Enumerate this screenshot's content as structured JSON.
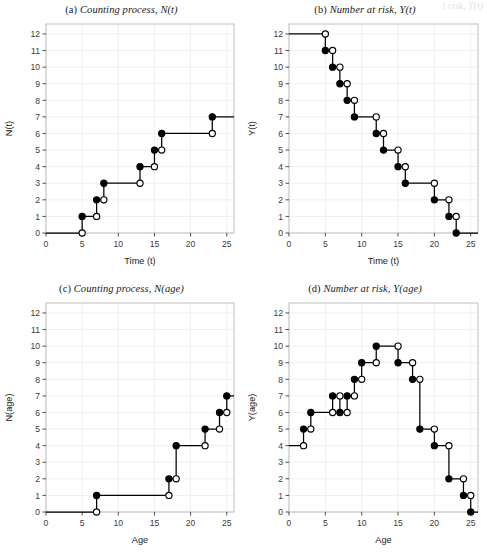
{
  "figure": {
    "artifact_text": "t risk, Y(t)"
  },
  "chart_data": [
    {
      "type": "line",
      "panel": "a",
      "tag": "(a)",
      "title": "Counting process, N(t)",
      "xlabel": "Time (t)",
      "ylabel": "N(t)",
      "xlim": [
        0,
        26
      ],
      "ylim": [
        0,
        12.6
      ],
      "xticks": [
        0,
        5,
        10,
        15,
        20,
        25
      ],
      "yticks": [
        0,
        1,
        2,
        3,
        4,
        5,
        6,
        7,
        8,
        9,
        10,
        11,
        12
      ],
      "grid": true,
      "step_type": "right-continuous-increasing",
      "x": [
        0,
        5,
        7,
        8,
        13,
        15,
        16,
        23,
        26
      ],
      "y": [
        0,
        1,
        2,
        3,
        4,
        5,
        6,
        7,
        7
      ],
      "jump_points": [
        {
          "x": 5,
          "from": 0,
          "to": 1
        },
        {
          "x": 7,
          "from": 1,
          "to": 2
        },
        {
          "x": 8,
          "from": 2,
          "to": 3
        },
        {
          "x": 13,
          "from": 3,
          "to": 4
        },
        {
          "x": 15,
          "from": 4,
          "to": 5
        },
        {
          "x": 16,
          "from": 5,
          "to": 6
        },
        {
          "x": 23,
          "from": 6,
          "to": 7
        }
      ]
    },
    {
      "type": "line",
      "panel": "b",
      "tag": "(b)",
      "title": "Number at risk, Y(t)",
      "xlabel": "Time (t)",
      "ylabel": "Y(t)",
      "xlim": [
        0,
        26
      ],
      "ylim": [
        0,
        12.6
      ],
      "xticks": [
        0,
        5,
        10,
        15,
        20,
        25
      ],
      "yticks": [
        0,
        1,
        2,
        3,
        4,
        5,
        6,
        7,
        8,
        9,
        10,
        11,
        12
      ],
      "grid": true,
      "step_type": "right-continuous-decreasing",
      "x": [
        0,
        5,
        6,
        7,
        8,
        9,
        12,
        13,
        15,
        16,
        20,
        22,
        23,
        26
      ],
      "y": [
        12,
        11,
        10,
        9,
        8,
        7,
        6,
        5,
        4,
        3,
        2,
        1,
        0,
        0
      ],
      "jump_points": [
        {
          "x": 5,
          "from": 12,
          "to": 11
        },
        {
          "x": 6,
          "from": 11,
          "to": 10
        },
        {
          "x": 7,
          "from": 10,
          "to": 9
        },
        {
          "x": 8,
          "from": 9,
          "to": 8
        },
        {
          "x": 9,
          "from": 8,
          "to": 7
        },
        {
          "x": 12,
          "from": 7,
          "to": 6
        },
        {
          "x": 13,
          "from": 6,
          "to": 5
        },
        {
          "x": 15,
          "from": 5,
          "to": 4
        },
        {
          "x": 16,
          "from": 4,
          "to": 3
        },
        {
          "x": 20,
          "from": 3,
          "to": 2
        },
        {
          "x": 22,
          "from": 2,
          "to": 1
        },
        {
          "x": 23,
          "from": 1,
          "to": 0
        }
      ]
    },
    {
      "type": "line",
      "panel": "c",
      "tag": "(c)",
      "title": "Counting process, N(age)",
      "xlabel": "Age",
      "ylabel": "N(age)",
      "xlim": [
        0,
        26
      ],
      "ylim": [
        0,
        12.6
      ],
      "xticks": [
        0,
        5,
        10,
        15,
        20,
        25
      ],
      "yticks": [
        0,
        1,
        2,
        3,
        4,
        5,
        6,
        7,
        8,
        9,
        10,
        11,
        12
      ],
      "grid": true,
      "step_type": "right-continuous-increasing",
      "x": [
        0,
        7,
        17,
        18,
        22,
        24,
        25,
        26
      ],
      "y": [
        0,
        1,
        2,
        4,
        5,
        6,
        7,
        7
      ],
      "jump_points": [
        {
          "x": 7,
          "from": 0,
          "to": 1
        },
        {
          "x": 17,
          "from": 1,
          "to": 2
        },
        {
          "x": 18,
          "from": 2,
          "to": 4
        },
        {
          "x": 22,
          "from": 4,
          "to": 5
        },
        {
          "x": 24,
          "from": 5,
          "to": 6
        },
        {
          "x": 25,
          "from": 6,
          "to": 7
        }
      ]
    },
    {
      "type": "line",
      "panel": "d",
      "tag": "(d)",
      "title": "Number at risk, Y(age)",
      "xlabel": "Age",
      "ylabel": "Y(age)",
      "xlim": [
        0,
        26
      ],
      "ylim": [
        0,
        12.6
      ],
      "xticks": [
        0,
        5,
        10,
        15,
        20,
        25
      ],
      "yticks": [
        0,
        1,
        2,
        3,
        4,
        5,
        6,
        7,
        8,
        9,
        10,
        11,
        12
      ],
      "grid": true,
      "step_type": "right-continuous-mixed",
      "x": [
        0,
        2,
        3,
        6,
        7,
        8,
        9,
        10,
        12,
        15,
        17,
        18,
        20,
        22,
        24,
        25,
        26
      ],
      "y": [
        4,
        5,
        6,
        7,
        6,
        7,
        8,
        9,
        10,
        9,
        8,
        5,
        4,
        2,
        1,
        0,
        0
      ],
      "jump_points": [
        {
          "x": 2,
          "from": 4,
          "to": 5
        },
        {
          "x": 3,
          "from": 5,
          "to": 6
        },
        {
          "x": 6,
          "from": 6,
          "to": 7
        },
        {
          "x": 7,
          "from": 7,
          "to": 6
        },
        {
          "x": 8,
          "from": 6,
          "to": 7
        },
        {
          "x": 9,
          "from": 7,
          "to": 8
        },
        {
          "x": 10,
          "from": 8,
          "to": 9
        },
        {
          "x": 12,
          "from": 9,
          "to": 10
        },
        {
          "x": 15,
          "from": 10,
          "to": 9
        },
        {
          "x": 17,
          "from": 9,
          "to": 8
        },
        {
          "x": 18,
          "from": 8,
          "to": 5
        },
        {
          "x": 20,
          "from": 5,
          "to": 4
        },
        {
          "x": 22,
          "from": 4,
          "to": 2
        },
        {
          "x": 24,
          "from": 2,
          "to": 1
        },
        {
          "x": 25,
          "from": 1,
          "to": 0
        }
      ]
    }
  ],
  "style": {
    "line_color": "#000000",
    "closed_marker_fill": "#000000",
    "open_marker_fill": "#ffffff",
    "grid_color": "#e8e8e8",
    "frame_color": "#b9b9b9",
    "tick_color": "#3a3a3a"
  }
}
